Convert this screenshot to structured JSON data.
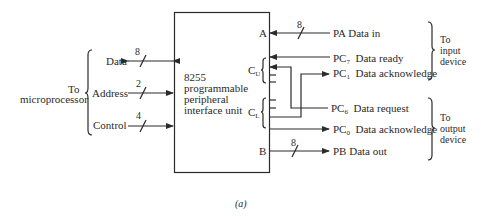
{
  "figure": {
    "caption": "(a)",
    "unit": {
      "line1": "8255",
      "line2": "programmable",
      "line3": "peripheral",
      "line4": "interface unit"
    },
    "left_group": {
      "line1": "To",
      "line2": "microprocessor"
    },
    "left_signals": [
      {
        "label": "Data",
        "width": "8",
        "direction": "bidirectional"
      },
      {
        "label": "Address",
        "width": "2",
        "direction": "in"
      },
      {
        "label": "Control",
        "width": "4",
        "direction": "in"
      }
    ],
    "ports": {
      "a": "A",
      "cu": "C",
      "cu_sub": "U",
      "cl": "C",
      "cl_sub": "L",
      "b": "B"
    },
    "right_signals": [
      {
        "prefix": "PA",
        "sub": "",
        "label": "Data in",
        "width": "8",
        "direction": "in"
      },
      {
        "prefix": "PC",
        "sub": "7",
        "label": "Data ready",
        "direction": "in"
      },
      {
        "prefix": "PC",
        "sub": "1",
        "label": "Data acknowledge",
        "direction": "out"
      },
      {
        "prefix": "PC",
        "sub": "6",
        "label": "Data request",
        "direction": "in"
      },
      {
        "prefix": "PC",
        "sub": "0",
        "label": "Data acknowledge",
        "direction": "out"
      },
      {
        "prefix": "PB",
        "sub": "",
        "label": "Data out",
        "width": "8",
        "direction": "out"
      }
    ],
    "input_group": {
      "line1": "To",
      "line2": "input",
      "line3": "device"
    },
    "output_group": {
      "line1": "To",
      "line2": "output",
      "line3": "device"
    }
  }
}
